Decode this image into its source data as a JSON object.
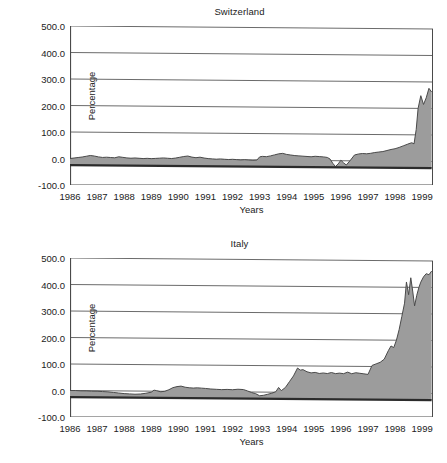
{
  "figure": {
    "panels": [
      "switzerland",
      "italy"
    ],
    "fill_color": "#9c9c9c",
    "line_color": "#4a4a4a",
    "axis_color": "#4a4a4a",
    "grid_color": "#6b6b6b",
    "baseline_color": "#2b2b2b",
    "background": "#ffffff"
  },
  "chart_data": [
    {
      "type": "area",
      "id": "switzerland",
      "title": "Switzerland",
      "xlabel": "Years",
      "ylabel": "Percentage",
      "ylim": [
        -100.0,
        500.0
      ],
      "xlim": [
        1986.0,
        1999.4
      ],
      "grid": true,
      "legend": "none",
      "ytick_labels": [
        "500.0",
        "400.0",
        "300.0",
        "200.0",
        "100.0",
        "0.0",
        "-100.0"
      ],
      "ytick_values": [
        500.0,
        400.0,
        300.0,
        200.0,
        100.0,
        0.0,
        -100.0
      ],
      "xtick_labels": [
        "1986",
        "1987",
        "1988",
        "1989",
        "1990",
        "1991",
        "1992",
        "1993",
        "1994",
        "1995",
        "1996",
        "1997",
        "1998",
        "1999"
      ],
      "xtick_values": [
        1986,
        1987,
        1988,
        1989,
        1990,
        1991,
        1992,
        1993,
        1994,
        1995,
        1996,
        1997,
        1998,
        1999
      ],
      "baseline_value": -25.0,
      "x": [
        1986.0,
        1986.15,
        1986.3,
        1986.45,
        1986.6,
        1986.75,
        1986.9,
        1987.05,
        1987.2,
        1987.35,
        1987.5,
        1987.65,
        1987.8,
        1987.95,
        1988.1,
        1988.25,
        1988.4,
        1988.55,
        1988.7,
        1988.85,
        1989.0,
        1989.15,
        1989.3,
        1989.45,
        1989.6,
        1989.75,
        1989.9,
        1990.05,
        1990.2,
        1990.35,
        1990.5,
        1990.65,
        1990.8,
        1990.95,
        1991.1,
        1991.25,
        1991.4,
        1991.55,
        1991.7,
        1991.85,
        1992.0,
        1992.15,
        1992.3,
        1992.45,
        1992.6,
        1992.75,
        1992.9,
        1993.0,
        1993.1,
        1993.25,
        1993.4,
        1993.55,
        1993.7,
        1993.85,
        1994.0,
        1994.15,
        1994.3,
        1994.45,
        1994.6,
        1994.75,
        1994.9,
        1995.05,
        1995.2,
        1995.35,
        1995.5,
        1995.6,
        1995.7,
        1995.8,
        1995.9,
        1996.0,
        1996.1,
        1996.2,
        1996.35,
        1996.5,
        1996.65,
        1996.8,
        1996.95,
        1997.1,
        1997.25,
        1997.4,
        1997.55,
        1997.7,
        1997.85,
        1998.0,
        1998.15,
        1998.3,
        1998.45,
        1998.55,
        1998.62,
        1998.7,
        1998.78,
        1998.85,
        1998.95,
        1999.05,
        1999.15,
        1999.25,
        1999.35
      ],
      "y": [
        0.0,
        2.0,
        4.0,
        6.0,
        9.0,
        12.0,
        10.0,
        7.0,
        5.0,
        6.0,
        5.0,
        4.0,
        8.0,
        6.0,
        4.0,
        3.0,
        4.0,
        3.0,
        2.0,
        3.0,
        2.0,
        3.0,
        4.0,
        5.0,
        4.0,
        3.0,
        5.0,
        8.0,
        11.0,
        13.0,
        9.0,
        7.0,
        9.0,
        6.0,
        4.0,
        3.0,
        2.0,
        3.0,
        2.0,
        1.0,
        2.0,
        1.0,
        0.0,
        1.0,
        0.0,
        -1.0,
        0.0,
        12.0,
        14.0,
        13.0,
        16.0,
        20.0,
        24.0,
        26.0,
        22.0,
        20.0,
        18.0,
        17.0,
        16.0,
        15.0,
        14.0,
        16.0,
        15.0,
        14.0,
        12.0,
        6.0,
        -10.0,
        -22.0,
        -12.0,
        2.0,
        -8.0,
        -16.0,
        2.0,
        22.0,
        26.0,
        28.0,
        27.0,
        29.0,
        32.0,
        34.0,
        36.0,
        40.0,
        44.0,
        47.0,
        52.0,
        58.0,
        64.0,
        68.0,
        70.0,
        66.0,
        120.0,
        200.0,
        248.0,
        215.0,
        240.0,
        276.0,
        262.0,
        290.0
      ]
    },
    {
      "type": "area",
      "id": "italy",
      "title": "Italy",
      "xlabel": "Years",
      "ylabel": "Percentage",
      "ylim": [
        -100.0,
        500.0
      ],
      "xlim": [
        1986.0,
        1999.4
      ],
      "grid": true,
      "legend": "none",
      "ytick_labels": [
        "500.0",
        "400.0",
        "300.0",
        "200.0",
        "100.0",
        "0.0",
        "-100.0"
      ],
      "ytick_values": [
        500.0,
        400.0,
        300.0,
        200.0,
        100.0,
        0.0,
        -100.0
      ],
      "xtick_labels": [
        "1986",
        "1987",
        "1988",
        "1989",
        "1990",
        "1991",
        "1992",
        "1993",
        "1994",
        "1995",
        "1996",
        "1997",
        "1998",
        "1999"
      ],
      "xtick_values": [
        1986,
        1987,
        1988,
        1989,
        1990,
        1991,
        1992,
        1993,
        1994,
        1995,
        1996,
        1997,
        1998,
        1999
      ],
      "baseline_value": -25.0,
      "x": [
        1986.0,
        1986.2,
        1986.4,
        1986.6,
        1986.8,
        1987.0,
        1987.2,
        1987.4,
        1987.6,
        1987.8,
        1988.0,
        1988.2,
        1988.4,
        1988.6,
        1988.8,
        1989.0,
        1989.1,
        1989.2,
        1989.35,
        1989.5,
        1989.65,
        1989.8,
        1989.95,
        1990.1,
        1990.25,
        1990.4,
        1990.55,
        1990.7,
        1990.85,
        1991.0,
        1991.2,
        1991.4,
        1991.6,
        1991.8,
        1992.0,
        1992.2,
        1992.4,
        1992.55,
        1992.7,
        1992.85,
        1993.0,
        1993.15,
        1993.3,
        1993.45,
        1993.6,
        1993.7,
        1993.8,
        1993.95,
        1994.1,
        1994.25,
        1994.4,
        1994.5,
        1994.6,
        1994.75,
        1994.9,
        1995.05,
        1995.2,
        1995.35,
        1995.5,
        1995.65,
        1995.8,
        1995.95,
        1996.1,
        1996.25,
        1996.4,
        1996.55,
        1996.7,
        1996.85,
        1997.0,
        1997.15,
        1997.3,
        1997.45,
        1997.6,
        1997.75,
        1997.85,
        1997.95,
        1998.05,
        1998.15,
        1998.25,
        1998.35,
        1998.42,
        1998.5,
        1998.58,
        1998.65,
        1998.72,
        1998.8,
        1998.88,
        1998.95,
        1999.05,
        1999.15,
        1999.25,
        1999.35
      ],
      "y": [
        0.0,
        0.0,
        -1.0,
        -1.0,
        -2.0,
        -2.0,
        -3.0,
        -4.0,
        -6.0,
        -8.0,
        -10.0,
        -11.0,
        -12.0,
        -11.0,
        -8.0,
        -4.0,
        4.0,
        2.0,
        -2.0,
        0.0,
        6.0,
        14.0,
        18.0,
        20.0,
        16.0,
        14.0,
        13.0,
        14.0,
        13.0,
        12.0,
        10.0,
        9.0,
        8.0,
        9.0,
        8.0,
        10.0,
        9.0,
        4.0,
        -2.0,
        -6.0,
        -14.0,
        -12.0,
        -8.0,
        -4.0,
        2.0,
        18.0,
        6.0,
        18.0,
        40.0,
        62.0,
        92.0,
        84.0,
        86.0,
        78.0,
        74.0,
        76.0,
        72.0,
        74.0,
        72.0,
        76.0,
        72.0,
        74.0,
        72.0,
        78.0,
        72.0,
        76.0,
        74.0,
        72.0,
        70.0,
        104.0,
        110.0,
        116.0,
        128.0,
        160.0,
        178.0,
        172.0,
        200.0,
        240.0,
        290.0,
        340.0,
        420.0,
        372.0,
        436.0,
        386.0,
        330.0,
        370.0,
        400.0,
        420.0,
        440.0,
        452.0,
        448.0,
        462.0
      ]
    }
  ]
}
